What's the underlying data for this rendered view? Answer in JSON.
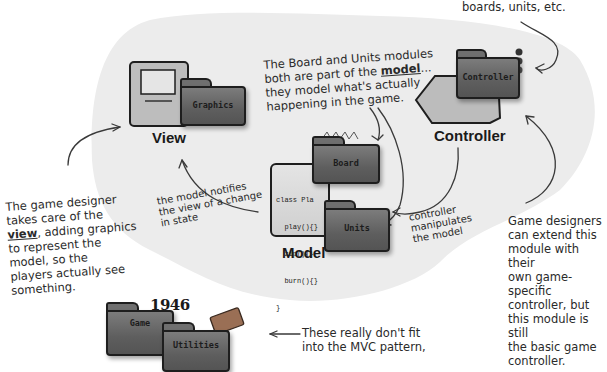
{
  "diagram": {
    "type": "mvc-architecture-sketch",
    "colors": {
      "blob": "#ececec",
      "folder": "#6a6a6a",
      "ink": "#2a2a2a",
      "label": "#1a1a1a"
    },
    "components": {
      "view": {
        "label": "View",
        "modules": [
          {
            "label": "Graphics",
            "icon": "computer-icon"
          }
        ]
      },
      "controller": {
        "label": "Controller",
        "modules": [
          {
            "label": "Controller",
            "icon": "arrow-shape-icon"
          }
        ]
      },
      "model": {
        "label": "Model",
        "modules": [
          {
            "label": "Board"
          },
          {
            "label": "Units"
          }
        ],
        "code": [
          "class Pla",
          "  play(){}",
          "  zip(){}",
          "  burn(){}",
          "}"
        ]
      },
      "outside": {
        "modules": [
          {
            "label": "Game",
            "badge": "1946"
          },
          {
            "label": "Utilities",
            "icon": "toolbox-icon"
          }
        ]
      }
    },
    "annotations": {
      "top_right": "boards, units, etc.",
      "model_note_parts": {
        "before": "The Board and Units modules\nboth are part of the ",
        "emph": "model",
        "after": "...\nthey model what's actually\nhappening in the game."
      },
      "view_note_parts": {
        "before": "The game designer\ntakes care of the\n",
        "emph": "view",
        "after": ", adding graphics\nto represent the\nmodel, so the\nplayers actually see\nsomething."
      },
      "model_notifies": "the model notifies\nthe view of a change\nin state",
      "controller_manipulates": "controller\nmanipulates\nthe model",
      "controller_extend": "Game designers\ncan extend this\nmodule with their\nown game-specific\ncontroller, but\nthis module is still\nthe basic game\ncontroller.",
      "outside_note": "These really don't fit\ninto the MVC pattern,"
    }
  }
}
